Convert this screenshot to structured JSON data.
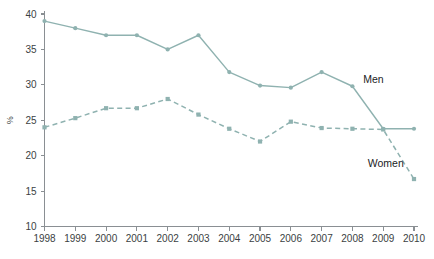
{
  "chart_data": {
    "type": "line",
    "title": "",
    "xlabel": "",
    "ylabel": "%",
    "x": [
      1998,
      1999,
      2000,
      2001,
      2002,
      2003,
      2004,
      2005,
      2006,
      2007,
      2008,
      2009,
      2010
    ],
    "categories": [
      "1998",
      "1999",
      "2000",
      "2001",
      "2002",
      "2003",
      "2004",
      "2005",
      "2006",
      "2007",
      "2008",
      "2009",
      "2010"
    ],
    "xlim": [
      1998,
      2010
    ],
    "ylim": [
      10,
      40
    ],
    "yticks": [
      10,
      15,
      20,
      25,
      30,
      35,
      40
    ],
    "ytick_labels": [
      "10",
      "15",
      "20",
      "25",
      "30",
      "35",
      "40"
    ],
    "grid": false,
    "legend_position": "inline-annotation",
    "series": [
      {
        "name": "Men",
        "style": "solid",
        "marker": "circle",
        "color": "#8fb2b0",
        "values": [
          39.0,
          38.0,
          37.0,
          37.0,
          35.0,
          37.0,
          31.8,
          29.9,
          29.6,
          31.8,
          29.8,
          23.8,
          23.8
        ]
      },
      {
        "name": "Women",
        "style": "dashed",
        "marker": "square",
        "color": "#8fb2b0",
        "values": [
          24.0,
          25.3,
          26.7,
          26.7,
          28.0,
          25.8,
          23.8,
          22.0,
          24.8,
          23.9,
          23.8,
          23.7,
          16.7
        ]
      }
    ],
    "annotations": [
      {
        "text": "Men",
        "x": 2008.35,
        "y": 30.2
      },
      {
        "text": "Women",
        "x": 2008.5,
        "y": 18.4
      }
    ]
  },
  "colors": {
    "series": "#8fb2b0",
    "axis": "#8a8f93",
    "text": "#3b3f43",
    "label_text": "#1b1c1e",
    "background": "#ffffff"
  }
}
